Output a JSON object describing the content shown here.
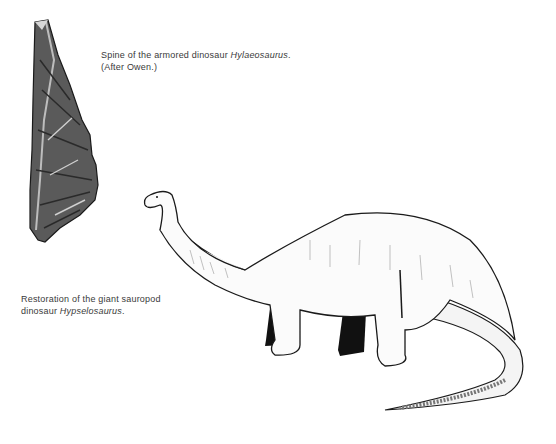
{
  "figures": [
    {
      "id": "spine",
      "caption_prefix": "Spine of the armored dinosaur ",
      "caption_taxon": "Hylaeosaurus",
      "caption_suffix": ".",
      "caption_line2": "(After Owen.)"
    },
    {
      "id": "sauropod",
      "caption_prefix": "Restoration of the giant sauropod",
      "caption_line2_prefix": "dinosaur ",
      "caption_taxon": "Hypselosaurus",
      "caption_suffix": "."
    }
  ],
  "colors": {
    "ink": "#1a1a1a",
    "fossil_dark": "#2b2b2b",
    "fossil_mid": "#6b6b6b",
    "paper": "#ffffff"
  }
}
